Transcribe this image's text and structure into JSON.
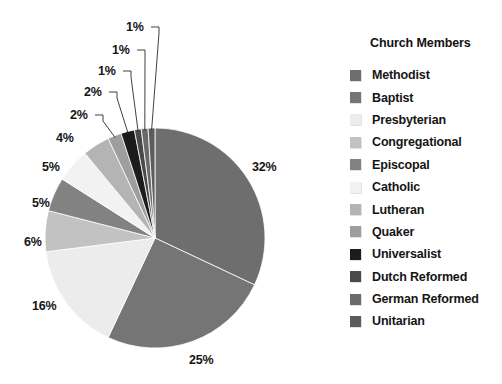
{
  "legend": {
    "title": "Church Members",
    "position": "right",
    "items": [
      {
        "label": "Methodist",
        "color": "#6e6e6e"
      },
      {
        "label": "Baptist",
        "color": "#757575"
      },
      {
        "label": "Presbyterian",
        "color": "#ececec"
      },
      {
        "label": "Congregational",
        "color": "#c2c2c2"
      },
      {
        "label": "Episcopal",
        "color": "#828282"
      },
      {
        "label": "Catholic",
        "color": "#f2f2f2"
      },
      {
        "label": "Lutheran",
        "color": "#b4b4b4"
      },
      {
        "label": "Quaker",
        "color": "#9e9e9e"
      },
      {
        "label": "Universalist",
        "color": "#1c1c1c"
      },
      {
        "label": "Dutch Reformed",
        "color": "#4a4a4a"
      },
      {
        "label": "German Reformed",
        "color": "#6a6a6a"
      },
      {
        "label": "Unitarian",
        "color": "#5c5c5c"
      }
    ]
  },
  "chart_data": {
    "type": "pie",
    "title": "Church Members",
    "start_angle_deg": 0,
    "direction": "clockwise",
    "unit": "%",
    "categories": [
      "Methodist",
      "Baptist",
      "Presbyterian",
      "Congregational",
      "Episcopal",
      "Catholic",
      "Lutheran",
      "Quaker",
      "Universalist",
      "Dutch Reformed",
      "German Reformed",
      "Unitarian"
    ],
    "values": [
      32,
      25,
      16,
      6,
      5,
      5,
      4,
      2,
      2,
      1,
      1,
      1
    ],
    "labels": [
      "32%",
      "25%",
      "16%",
      "6%",
      "5%",
      "5%",
      "4%",
      "2%",
      "2%",
      "1%",
      "1%",
      "1%"
    ],
    "colors": [
      "#6e6e6e",
      "#757575",
      "#ececec",
      "#c2c2c2",
      "#828282",
      "#f2f2f2",
      "#b4b4b4",
      "#9e9e9e",
      "#1c1c1c",
      "#4a4a4a",
      "#6a6a6a",
      "#5c5c5c"
    ],
    "slice_labels": [
      {
        "text": "32%",
        "x": 252,
        "y": 160,
        "leader": false
      },
      {
        "text": "25%",
        "x": 189,
        "y": 353,
        "leader": false
      },
      {
        "text": "16%",
        "x": 32,
        "y": 299,
        "leader": false
      },
      {
        "text": "6%",
        "x": 24,
        "y": 235,
        "leader": false
      },
      {
        "text": "5%",
        "x": 32,
        "y": 196,
        "leader": false
      },
      {
        "text": "5%",
        "x": 42,
        "y": 160,
        "leader": false
      },
      {
        "text": "4%",
        "x": 56,
        "y": 131,
        "leader": false
      },
      {
        "text": "2%",
        "x": 70,
        "y": 108,
        "leader": true
      },
      {
        "text": "2%",
        "x": 84,
        "y": 85,
        "leader": true
      },
      {
        "text": "1%",
        "x": 98,
        "y": 64,
        "leader": true
      },
      {
        "text": "1%",
        "x": 112,
        "y": 43,
        "leader": true
      },
      {
        "text": "1%",
        "x": 126,
        "y": 20,
        "leader": true
      }
    ]
  },
  "geometry": {
    "cx": 155,
    "cy": 238,
    "r": 110
  }
}
